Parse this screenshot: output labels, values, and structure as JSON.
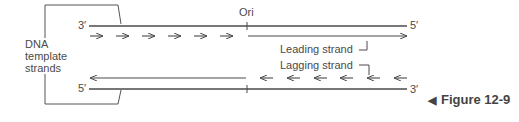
{
  "diagram": {
    "side_label": [
      "DNA",
      "template",
      "strands"
    ],
    "origin_label": "Ori",
    "top_strand": {
      "left_end": "3′",
      "right_end": "5′"
    },
    "bottom_strand": {
      "left_end": "5′",
      "right_end": "3′"
    },
    "leading_label": "Leading strand",
    "lagging_label": "Lagging strand",
    "figure_caption": "Figure 12-9",
    "caption_marker": "◀",
    "colors": {
      "line": "#4a4a4a",
      "text": "#4a4a4a"
    }
  }
}
